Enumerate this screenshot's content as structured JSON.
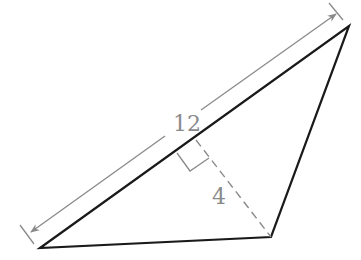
{
  "diagram": {
    "type": "triangle-area-figure",
    "base_label": "12",
    "height_label": "4",
    "colors": {
      "triangle": "#1a1a1a",
      "dimension": "#8a8a8a",
      "altitude": "#8a8a8a"
    },
    "vertices": {
      "bottom_left": [
        40,
        248
      ],
      "top_right": [
        349,
        26
      ],
      "bottom_right": [
        271,
        237
      ]
    },
    "altitude_foot": [
      196,
      140
    ]
  }
}
